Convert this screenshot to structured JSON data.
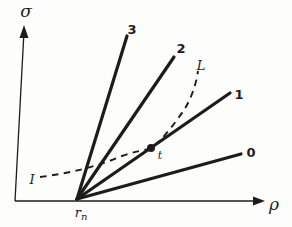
{
  "figure": {
    "bg": "#fdfdfb",
    "ink": "#1c1c1c"
  },
  "axes": {
    "y_label": "σ",
    "x_label": "ρ",
    "y_axis": {
      "x1": 24,
      "y1": 31,
      "x2": 15,
      "y2": 201
    },
    "x_axis": {
      "x1": 15,
      "y1": 201,
      "x2": 256,
      "y2": 201
    },
    "y_arrowhead_points": "24,25 19.5,38 28.5,38",
    "x_arrowhead_points": "265,201 253,196.5 253,205.5"
  },
  "origin": {
    "label_base": "r",
    "label_sub": "n"
  },
  "rays": [
    {
      "label": "3",
      "x1": 77,
      "y1": 199,
      "x2": 127,
      "y2": 36
    },
    {
      "label": "2",
      "x1": 77,
      "y1": 199,
      "x2": 174,
      "y2": 57
    },
    {
      "label": "1",
      "x1": 77,
      "y1": 199,
      "x2": 230,
      "y2": 93
    },
    {
      "label": "0",
      "x1": 77,
      "y1": 199,
      "x2": 241,
      "y2": 154
    }
  ],
  "curve": {
    "start_label": "I",
    "end_label": "L",
    "path": "M 40 177 C 70 173 96 167 122 156 C 135 151 143 151 151 148 C 161 142 175 123 184 110 C 191 99 196 85 198 71",
    "dash_pattern": "6.5 5.5",
    "point": {
      "label": "t",
      "cx": 151,
      "cy": 148,
      "r": 4
    }
  }
}
